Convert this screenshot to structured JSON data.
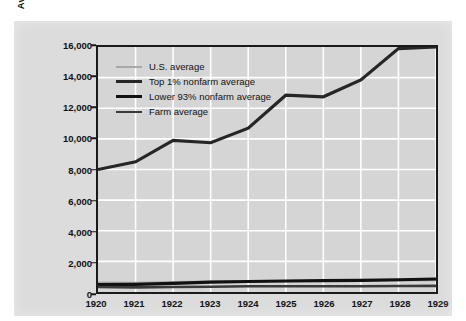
{
  "chart_data": {
    "type": "line",
    "title": "",
    "xlabel": "",
    "ylabel": "Average Real per Capita Disposable Income (1929 dollars)",
    "ylabel_line1": "Average Real per Capita Disposable Income",
    "ylabel_line2": "(1929 dollars)",
    "x": [
      1920,
      1921,
      1922,
      1923,
      1924,
      1925,
      1926,
      1927,
      1928,
      1929
    ],
    "xtick_labels": [
      "1920",
      "1921",
      "1922",
      "1923",
      "1924",
      "1925",
      "1926",
      "1927",
      "1928",
      "1929"
    ],
    "ylim": [
      0,
      16000
    ],
    "ytick_values": [
      0,
      2000,
      4000,
      6000,
      8000,
      10000,
      12000,
      14000,
      16000
    ],
    "ytick_labels": [
      "0",
      "2,000",
      "4,000",
      "6,000",
      "8,000",
      "10,000",
      "12,000",
      "14,000",
      "16,000"
    ],
    "grid": true,
    "grid_color": "#ffffff",
    "plot_background": "#d5d5d5",
    "legend_position": "upper-left",
    "series": [
      {
        "name": "U.S. average",
        "color": "#a8a8a8",
        "width": 2.2,
        "values": [
          620,
          600,
          640,
          680,
          690,
          710,
          730,
          730,
          750,
          770
        ]
      },
      {
        "name": "Top 1% nonfarm average",
        "color": "#262626",
        "width": 3.2,
        "values": [
          8000,
          8500,
          9900,
          9750,
          10700,
          12850,
          12750,
          13850,
          15900,
          16000
        ]
      },
      {
        "name": "Lower 93% nonfarm average",
        "color": "#111111",
        "width": 3.2,
        "values": [
          490,
          500,
          560,
          640,
          690,
          720,
          740,
          760,
          800,
          850
        ]
      },
      {
        "name": "Farm average",
        "color": "#3a3a3a",
        "width": 2.6,
        "values": [
          330,
          300,
          320,
          350,
          370,
          380,
          380,
          380,
          390,
          400
        ]
      }
    ]
  }
}
